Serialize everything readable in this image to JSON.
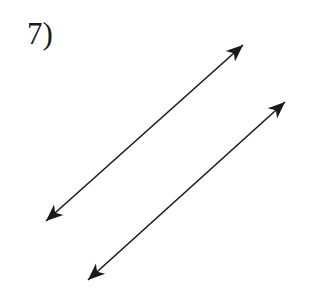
{
  "problem": {
    "number_label": "7)"
  },
  "diagram": {
    "stroke_color": "#1a1a1a",
    "lines": [
      {
        "name": "upper-line",
        "x1": 46,
        "y1": 221,
        "x2": 243,
        "y2": 45
      },
      {
        "name": "lower-line",
        "x1": 88,
        "y1": 280,
        "x2": 285,
        "y2": 102
      }
    ]
  }
}
